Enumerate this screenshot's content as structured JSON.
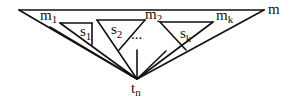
{
  "diagram": {
    "type": "tree-decomposition-triangles",
    "labels": {
      "m": "m",
      "m1": "m",
      "m1_sub": "1",
      "m2": "m",
      "m2_sub": "2",
      "mk": "m",
      "mk_sub": "k",
      "s1": "s",
      "s1_sub": "1",
      "s2": "s",
      "s2_sub": "2",
      "sk": "s",
      "sk_sub": "k",
      "ellipsis": "...",
      "tn": "t",
      "tn_sub": "n"
    },
    "colors": {
      "stroke": "#111111",
      "background": "#ffffff"
    }
  }
}
